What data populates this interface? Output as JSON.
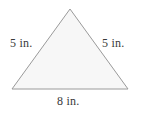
{
  "figure": {
    "shape_name": "triangle",
    "background_color": "#ffffff",
    "fill_color": "#f7f7f7",
    "stroke_color": "#9a9a9a",
    "text_color": "#3a3a3a",
    "vertices": {
      "apex": [
        70,
        9
      ],
      "bottom_left": [
        12,
        89
      ],
      "bottom_right": [
        128,
        89
      ]
    },
    "labels": {
      "left_side": "5 in.",
      "right_side": "5 in.",
      "bottom_side": "8 in."
    }
  }
}
